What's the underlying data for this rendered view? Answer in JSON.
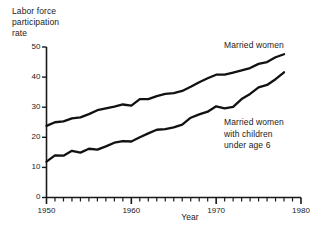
{
  "chart_data": {
    "type": "line",
    "title": "",
    "ylabel": "Labor force\nparticipation\nrate",
    "xlabel": "Year",
    "xlim": [
      1950,
      1980
    ],
    "ylim": [
      0,
      50
    ],
    "xticks": [
      1950,
      1960,
      1970,
      1980
    ],
    "xtick_labels": [
      "1950",
      "1960",
      "1970",
      "1980"
    ],
    "yticks": [
      0,
      10,
      20,
      30,
      40,
      50
    ],
    "ytick_labels": [
      "0",
      "10",
      "20",
      "30",
      "40",
      "50"
    ],
    "minor_xtick_interval": 1,
    "grid": false,
    "legend_position": "inline-annotation",
    "x": [
      1950,
      1951,
      1952,
      1953,
      1954,
      1955,
      1956,
      1957,
      1958,
      1959,
      1960,
      1961,
      1962,
      1963,
      1964,
      1965,
      1966,
      1967,
      1968,
      1969,
      1970,
      1971,
      1972,
      1973,
      1974,
      1975,
      1976,
      1977,
      1978
    ],
    "series": [
      {
        "name": "Married women",
        "label": "Married women",
        "color": "#111111",
        "values": [
          23.8,
          25.0,
          25.3,
          26.3,
          26.6,
          27.7,
          29.0,
          29.6,
          30.2,
          30.9,
          30.5,
          32.7,
          32.7,
          33.7,
          34.4,
          34.7,
          35.4,
          36.8,
          38.3,
          39.6,
          40.8,
          40.8,
          41.5,
          42.2,
          43.0,
          44.4,
          45.0,
          46.6,
          47.6
        ]
      },
      {
        "name": "Married women with children under age 6",
        "label": "Married women\nwith children\nunder age 6",
        "color": "#111111",
        "values": [
          11.9,
          14.0,
          13.9,
          15.5,
          14.9,
          16.2,
          15.9,
          17.0,
          18.2,
          18.7,
          18.6,
          20.0,
          21.3,
          22.5,
          22.7,
          23.3,
          24.2,
          26.5,
          27.6,
          28.5,
          30.3,
          29.6,
          30.1,
          32.7,
          34.4,
          36.6,
          37.4,
          39.3,
          41.6
        ]
      }
    ]
  }
}
